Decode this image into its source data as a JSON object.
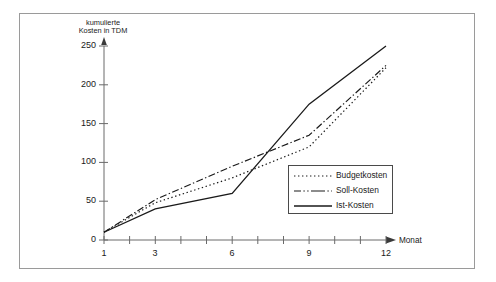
{
  "figure": {
    "border_color": "#9a9a9a",
    "background": "#ffffff",
    "ink_color": "#1a1a1a"
  },
  "axes": {
    "y_title_line1": "kumulierte",
    "y_title_line2": "Kosten in TDM",
    "x_title": "Monat",
    "y_ticks": [
      "0",
      "50",
      "100",
      "150",
      "200",
      "250"
    ],
    "x_ticks_labeled": [
      "1",
      "3",
      "6",
      "9",
      "12"
    ]
  },
  "legend": {
    "items": [
      {
        "label": "Budgetkosten",
        "style": "dotted"
      },
      {
        "label": "Soll-Kosten",
        "style": "dash-dot"
      },
      {
        "label": "Ist-Kosten",
        "style": "solid"
      }
    ]
  },
  "chart_data": {
    "type": "line",
    "title": "",
    "xlabel": "Monat",
    "ylabel": "kumulierte Kosten in TDM",
    "xlim": [
      1,
      12
    ],
    "ylim": [
      0,
      250
    ],
    "grid": false,
    "legend_position": "inside-right",
    "x": [
      1,
      3,
      6,
      9,
      12
    ],
    "series": [
      {
        "name": "Budgetkosten",
        "style": "dotted",
        "color": "#1a1a1a",
        "values": [
          10,
          48,
          80,
          120,
          222
        ]
      },
      {
        "name": "Soll-Kosten",
        "style": "dash-dot",
        "color": "#1a1a1a",
        "values": [
          10,
          52,
          95,
          135,
          225
        ]
      },
      {
        "name": "Ist-Kosten",
        "style": "solid",
        "color": "#1a1a1a",
        "values": [
          10,
          40,
          60,
          175,
          250
        ]
      }
    ]
  }
}
